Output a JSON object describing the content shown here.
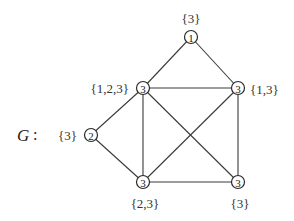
{
  "graph": {
    "name": "G",
    "separator": ":",
    "nodes": [
      {
        "id": "top",
        "value": "1",
        "label": "{3}",
        "x": 191,
        "y": 37
      },
      {
        "id": "upper-left",
        "value": "3",
        "label": "{1,2,3}",
        "x": 143,
        "y": 88
      },
      {
        "id": "upper-right",
        "value": "3",
        "label": "{1,3}",
        "x": 238,
        "y": 88
      },
      {
        "id": "left",
        "value": "2",
        "label": "{3}",
        "x": 91,
        "y": 135
      },
      {
        "id": "bottom-left",
        "value": "3",
        "label": "{2,3}",
        "x": 143,
        "y": 182
      },
      {
        "id": "bottom-right",
        "value": "3",
        "label": "{3}",
        "x": 238,
        "y": 182
      }
    ],
    "edges": [
      [
        "top",
        "upper-left"
      ],
      [
        "top",
        "upper-right"
      ],
      [
        "upper-left",
        "upper-right"
      ],
      [
        "upper-left",
        "left"
      ],
      [
        "upper-left",
        "bottom-left"
      ],
      [
        "upper-left",
        "bottom-right"
      ],
      [
        "upper-right",
        "bottom-left"
      ],
      [
        "upper-right",
        "bottom-right"
      ],
      [
        "left",
        "bottom-left"
      ],
      [
        "bottom-left",
        "bottom-right"
      ]
    ]
  }
}
